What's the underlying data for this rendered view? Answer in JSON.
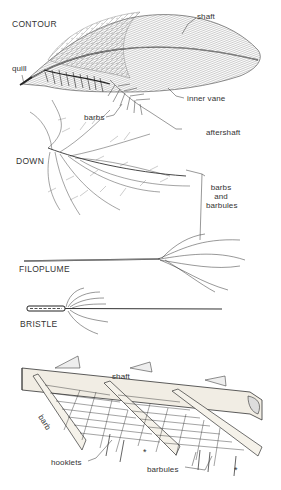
{
  "diagram": {
    "sections": [
      {
        "id": "contour",
        "title": "CONTOUR",
        "labels": [
          "shaft",
          "quill",
          "inner vane",
          "barbs",
          "aftershaft"
        ]
      },
      {
        "id": "down",
        "title": "DOWN",
        "labels": [
          "barbs and barbules"
        ]
      },
      {
        "id": "filoplume",
        "title": "FILOPLUME",
        "labels": []
      },
      {
        "id": "bristle",
        "title": "BRISTLE",
        "labels": []
      },
      {
        "id": "barb-structure",
        "title": "",
        "labels": [
          "shaft",
          "barb",
          "hooklets",
          "barbules",
          "*",
          "*"
        ]
      }
    ]
  },
  "labels": {
    "contour_title": "CONTOUR",
    "contour_shaft": "shaft",
    "contour_quill": "quill",
    "contour_inner_vane": "inner vane",
    "contour_barbs": "barbs",
    "contour_aftershaft": "aftershaft",
    "down_title": "DOWN",
    "barbs_line1": "barbs",
    "barbs_line2": "and",
    "barbs_line3": "barbules",
    "filoplume_title": "FILOPLUME",
    "bristle_title": "BRISTLE",
    "detail_shaft": "shaft",
    "detail_barb": "barb",
    "detail_hooklets": "hooklets",
    "detail_barbules": "barbules",
    "asterisk": "*"
  },
  "colors": {
    "ink": "#2a2a2a",
    "background": "#ffffff",
    "shaft_fill": "#f1ede4"
  }
}
